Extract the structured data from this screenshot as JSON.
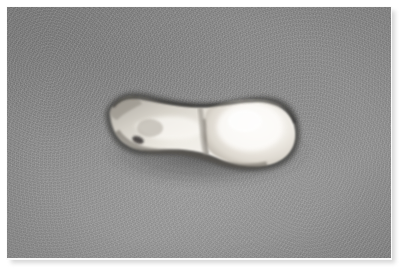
{
  "image": {
    "kind": "photograph",
    "medium": "grayscale photographic print",
    "subject": "extracted tooth specimen",
    "orientation": "landscape",
    "width_px": 405,
    "height_px": 274,
    "caption": "",
    "border": {
      "style": "white keyline with soft drop shadow",
      "keyline_color": "#fbfbfb",
      "shadow_color": "#d7d7d7"
    },
    "photo_area": {
      "left_px": 7,
      "top_px": 7,
      "width_px": 384,
      "height_px": 251
    },
    "background": {
      "description": "uniform medium-gray textured felt backdrop with fine film grain",
      "base_color": "#8d8d8d",
      "light_color": "#989898",
      "dark_color": "#858585"
    },
    "subject_detail": {
      "description": "single elongated off-white specimen lying horizontally, tapered root to the left, bulbous rounded crown to the right, pinched cervical groove near center",
      "highlight_color": "#f4f2ee",
      "midtone_color": "#d9d5cd",
      "shadow_color": "#6f6c68",
      "outline_color": "#3e3c3a",
      "bounding_box": {
        "left_px": 100,
        "top_px": 88,
        "width_px": 195,
        "height_px": 80
      },
      "features": [
        "dark pit mark on the root near the left third",
        "dark contour line along the superior margin",
        "cast shadow beneath the inferior margin",
        "bright specular highlight across the crown"
      ]
    }
  }
}
